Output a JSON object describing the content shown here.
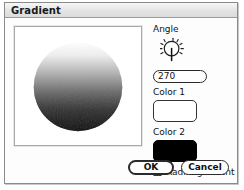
{
  "window": {
    "title": "Gradient"
  },
  "preview": {
    "shape": "circle",
    "gradient_from": "#ffffff",
    "gradient_to": "#000000",
    "background": "#ffffff"
  },
  "controls": {
    "angle": {
      "label": "Angle",
      "value": "270",
      "dial_icon": "angle-dial-icon"
    },
    "color1": {
      "label": "Color 1",
      "value": "#ffffff"
    },
    "color2": {
      "label": "Color 2",
      "value": "#000000"
    },
    "radial": {
      "label": "Radial gradient",
      "checked": false
    }
  },
  "buttons": {
    "ok": "OK",
    "cancel": "Cancel"
  }
}
